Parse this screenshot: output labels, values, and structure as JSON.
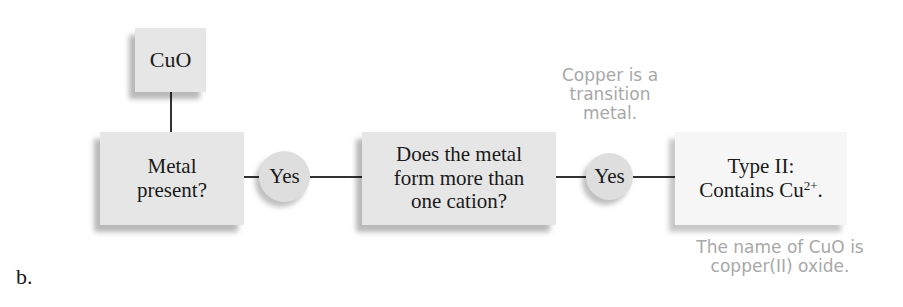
{
  "figure_label": "b.",
  "compound": {
    "formula": "CuO"
  },
  "flow": {
    "step1": {
      "line1": "Metal",
      "line2": "present?"
    },
    "answer1": "Yes",
    "step2": {
      "line1": "Does the metal",
      "line2": "form more than",
      "line3": "one cation?"
    },
    "answer2": "Yes",
    "result": {
      "line1": "Type II:",
      "line2_prefix": "Contains Cu",
      "line2_sup": "2+",
      "line2_suffix": "."
    }
  },
  "annotations": {
    "transition_note": {
      "line1": "Copper is a",
      "line2": "transition",
      "line3": "metal."
    },
    "name_note": {
      "line1": "The name of CuO is",
      "line2": "copper(II) oxide."
    }
  },
  "colors": {
    "box_fill": "#e6e6e6",
    "result_fill": "#f6f6f6",
    "circle_fill": "#dedede",
    "annotation_text": "#a8a8a8",
    "main_text": "#1a1a1a",
    "connector": "#333333"
  }
}
